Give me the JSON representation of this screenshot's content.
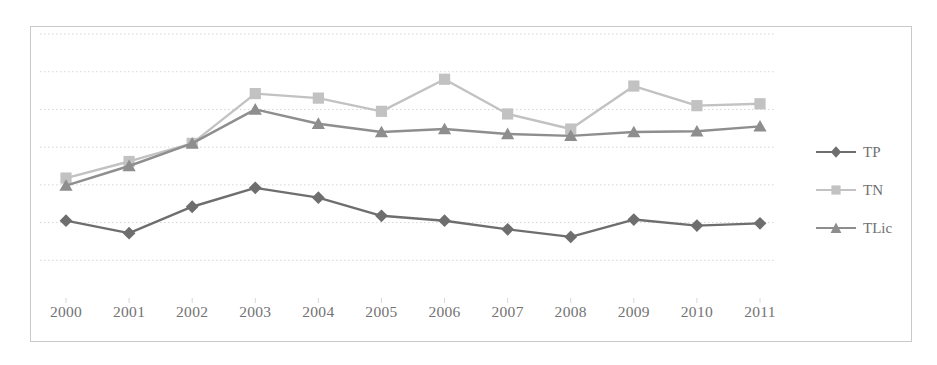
{
  "chart_data": {
    "type": "line",
    "title": "",
    "subtitle": "",
    "xlabel": "",
    "ylabel": "",
    "categories": [
      "2000",
      "2001",
      "2002",
      "2003",
      "2004",
      "2005",
      "2006",
      "2007",
      "2008",
      "2009",
      "2010",
      "2011"
    ],
    "series": [
      {
        "name": "TP",
        "marker": "diamond",
        "color": "#6e6e6e",
        "values": [
          2.05,
          1.72,
          2.42,
          2.92,
          2.66,
          2.18,
          2.05,
          1.82,
          1.62,
          2.08,
          1.92,
          1.98
        ]
      },
      {
        "name": "TN",
        "marker": "square",
        "color": "#c2c2c2",
        "values": [
          3.18,
          3.62,
          4.1,
          5.42,
          5.3,
          4.95,
          5.8,
          4.88,
          4.48,
          5.62,
          5.1,
          5.15
        ]
      },
      {
        "name": "TLic",
        "marker": "triangle",
        "color": "#8e8e8e",
        "values": [
          2.98,
          3.5,
          4.1,
          5.0,
          4.62,
          4.4,
          4.48,
          4.35,
          4.3,
          4.4,
          4.42,
          4.55
        ]
      }
    ],
    "ylim": [
      0,
      7
    ],
    "yticks": [
      1,
      2,
      3,
      4,
      5,
      6,
      7
    ],
    "ytick_labels_visible": false,
    "grid": true,
    "grid_style": "dotted-horizontal",
    "legend_position": "right",
    "legend_entries": [
      "TP",
      "TN",
      "TLic"
    ]
  },
  "axis": {
    "x_labels": [
      "2000",
      "2001",
      "2002",
      "2003",
      "2004",
      "2005",
      "2006",
      "2007",
      "2008",
      "2009",
      "2010",
      "2011"
    ]
  },
  "legend": {
    "items": [
      {
        "label": "TP"
      },
      {
        "label": "TN"
      },
      {
        "label": "TLic"
      }
    ]
  },
  "colors": {
    "tp": "#6e6e6e",
    "tn": "#c2c2c2",
    "tlic": "#8e8e8e",
    "grid": "#d8d8d8",
    "frame": "#c9c9c9",
    "text": "#737373",
    "background": "#ffffff"
  }
}
